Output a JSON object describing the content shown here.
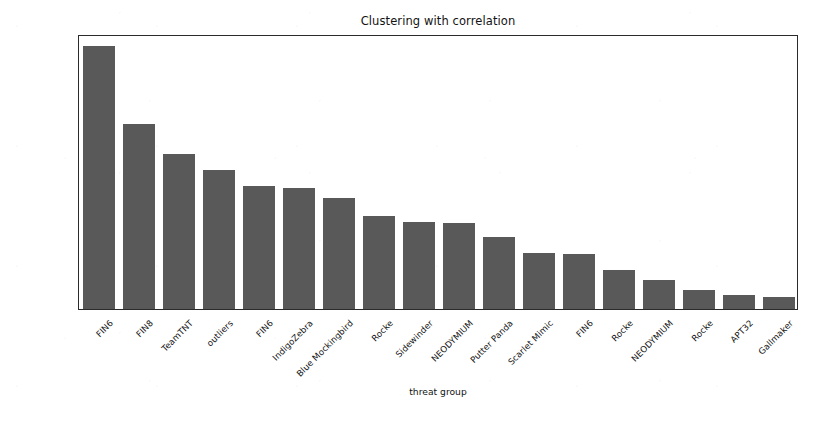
{
  "figure": {
    "title": "Clustering with correlation",
    "background_color": "#ffffff",
    "bar_color": "#595959",
    "axis_color": "#2b2b2b"
  },
  "axes": {
    "x_label": "threat group",
    "y_label": "Occurences",
    "y_scale": "log",
    "y_major_ticks": [
      {
        "value": 1000,
        "mantissa": "10",
        "exponent": "3"
      },
      {
        "value": 100,
        "mantissa": "10",
        "exponent": "2"
      }
    ]
  },
  "chart_data": {
    "type": "bar",
    "title": "Clustering with correlation",
    "xlabel": "threat group",
    "ylabel": "Occurences",
    "yscale": "log",
    "ylim": [
      40,
      7000
    ],
    "grid": false,
    "legend": "none",
    "ytick_labels": [
      "10²",
      "10³"
    ],
    "ytick_values": [
      100,
      1000
    ],
    "categories": [
      "FIN6",
      "FIN8",
      "TeamTNT",
      "outliers",
      "FIN6",
      "IndigoZebra",
      "Blue Mockingbird",
      "Rocke",
      "Sidewinder",
      "NEODYMIUM",
      "Putter Panda",
      "Scarlet Mimic",
      "FIN6",
      "Rocke",
      "NEODYMIUM",
      "Rocke",
      "APT32",
      "Gallmaker"
    ],
    "values": [
      5570,
      1280,
      730,
      540,
      400,
      390,
      320,
      230,
      205,
      200,
      155,
      115,
      112,
      84,
      69,
      57,
      52,
      50
    ]
  }
}
